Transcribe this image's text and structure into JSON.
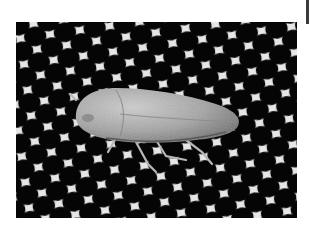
{
  "image": {
    "alt": "Grayscale photograph of a leafhopper resting on a white hexagonal mesh screen",
    "subject": "leafhopper",
    "background": "hexagonal-mesh",
    "colors": {
      "mesh": "#e8e8e8",
      "holes": "#050505",
      "insect_body": "#9a9a9a",
      "insect_highlight": "#c4c4c4",
      "insect_shadow": "#6e6e6e",
      "page_bg": "#ffffff",
      "edge_bar": "#3a3a3a"
    }
  }
}
